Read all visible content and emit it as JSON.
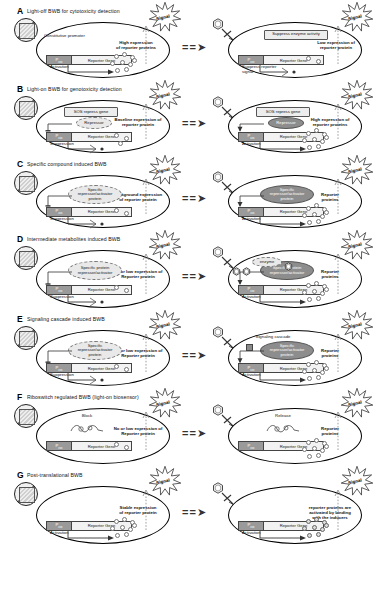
{
  "figure": {
    "top_letter": "",
    "separator": "= = ➤",
    "signal_label": "Signal",
    "promoter_label": "P",
    "promoter_sub": "xxx",
    "gene_label": "Reporter Gene",
    "activation_label": "Activation",
    "suppression_label": "Suppression"
  },
  "panels": [
    {
      "letter": "A",
      "title": "Light-off BWB for cytotoxicity detection",
      "left": {
        "promoter_note": "Constitutive promoter",
        "expression_note": "High expression\nof reporter proteins",
        "bottom_note": "Activation",
        "boxes": []
      },
      "right": {
        "box": "Suppress enzyme activity",
        "expression_note": "Low expression  of\nreporter protein",
        "bottom_note": "Suppress reporter  signal"
      }
    },
    {
      "letter": "B",
      "title": "Light-on BWB for genotoxicity detection",
      "left": {
        "box": "SOS repress gene",
        "ellipse": "Repressor",
        "expression_note": "Baseline expression of\nreporter protein",
        "bottom_note": "Suppression"
      },
      "right": {
        "box": "SOS repress gene",
        "ellipse": "Repressor",
        "expression_note": "High expression of\nreporter proteins",
        "bottom_note": "Activation"
      }
    },
    {
      "letter": "C",
      "title": "Specific compound induced BWB",
      "left": {
        "ellipse": "Specific\nrepressor/activator\nprotein",
        "expression_note": "background expression\nof reporter  protein",
        "bottom_note": "Suppression"
      },
      "right": {
        "ellipse": "Specific\nrepressor/activator\nprotein",
        "expression_note": "Reporter\nproteins",
        "bottom_note": "Activation"
      }
    },
    {
      "letter": "D",
      "title": "Intermediate metabolites induced BWB",
      "left": {
        "ellipse": "Specific protein\nrepressor/activator",
        "expression_note": "No or low expression  of\nReporter  protein",
        "bottom_note": "Suppression"
      },
      "right": {
        "enzyme": "enzyme",
        "ellipse": "Specific protein\nrepressor/activator",
        "expression_note": "Reporter\nproteins",
        "bottom_note": "Activation"
      }
    },
    {
      "letter": "E",
      "title": "Signaling cascade induced BWB",
      "left": {
        "ellipse": "Specific\nrepressor/activator\nprotein",
        "expression_note": "No or low expression of\nReporter  protein",
        "bottom_note": "Suppression"
      },
      "right": {
        "cascade": "Signaling cascade",
        "ellipse": "Specific\nrepressor/activator\nprotein",
        "expression_note": "Reporter\nproteins",
        "bottom_note": "Activation"
      }
    },
    {
      "letter": "F",
      "title": "Riboswitch regulated BWB (light-on biosensor)",
      "left": {
        "state": "Block",
        "expression_note": "No or low expression of\nReporter  protein"
      },
      "right": {
        "state": "Release",
        "expression_note": "Reporter\nproteins"
      }
    },
    {
      "letter": "G",
      "title": "Post-translational BWB",
      "left": {
        "expression_note": "Stable expression\nof reporter  protein",
        "bottom_note": "Activation"
      },
      "right": {
        "expression_note": "reporter proteins are\nactivated by binding\nwith the inducers",
        "bottom_note": "Activation"
      }
    }
  ]
}
